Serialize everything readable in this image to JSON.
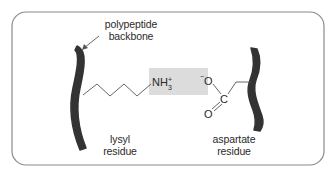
{
  "diagram": {
    "labels": {
      "backbone_line1": "polypeptide",
      "backbone_line2": "backbone",
      "lysyl_line1": "lysyl",
      "lysyl_line2": "residue",
      "aspartate_line1": "aspartate",
      "aspartate_line2": "residue"
    },
    "chemistry": {
      "amine_main": "NH",
      "amine_charge": "+",
      "amine_subscript": "3",
      "carboxylate_charge": "−",
      "carboxylate_o_single": "O",
      "carbon": "C",
      "carboxylate_o_double": "O"
    },
    "colors": {
      "frame_stroke": "#8a8a8a",
      "backbone_fill": "#333333",
      "interaction_box": "#dcdcdc",
      "bond_stroke": "#555555",
      "text": "#2a2a2a"
    }
  }
}
